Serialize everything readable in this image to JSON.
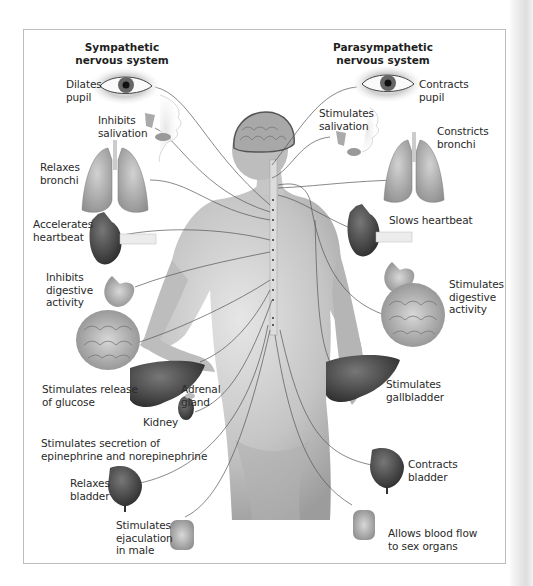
{
  "headers": {
    "sympathetic": [
      "Sympathetic",
      "nervous system"
    ],
    "parasympathetic": [
      "Parasympathetic",
      "nervous system"
    ]
  },
  "sympathetic_effects": [
    {
      "organ": "eye",
      "lines": [
        "Dilates",
        "pupil"
      ]
    },
    {
      "organ": "salivary-glands",
      "lines": [
        "Inhibits",
        "salivation"
      ]
    },
    {
      "organ": "lungs",
      "lines": [
        "Relaxes",
        "bronchi"
      ]
    },
    {
      "organ": "heart",
      "lines": [
        "Accelerates",
        "heartbeat"
      ]
    },
    {
      "organ": "stomach-intestines",
      "lines": [
        "Inhibits",
        "digestive",
        "activity"
      ]
    },
    {
      "organ": "liver",
      "lines": [
        "Stimulates release",
        "of glucose"
      ]
    },
    {
      "organ": "adrenal-gland",
      "lines": [
        "Adrenal",
        "gland"
      ]
    },
    {
      "organ": "kidney",
      "lines": [
        "Kidney"
      ]
    },
    {
      "organ": "adrenal-secretion",
      "lines": [
        "Stimulates secretion of",
        "epinephrine and norepinephrine"
      ]
    },
    {
      "organ": "bladder",
      "lines": [
        "Relaxes",
        "bladder"
      ]
    },
    {
      "organ": "genitals",
      "lines": [
        "Stimulates",
        "ejaculation",
        "in male"
      ]
    }
  ],
  "parasympathetic_effects": [
    {
      "organ": "eye",
      "lines": [
        "Contracts",
        "pupil"
      ]
    },
    {
      "organ": "salivary-glands",
      "lines": [
        "Stimulates",
        "salivation"
      ]
    },
    {
      "organ": "lungs",
      "lines": [
        "Constricts",
        "bronchi"
      ]
    },
    {
      "organ": "heart",
      "lines": [
        "Slows heartbeat"
      ]
    },
    {
      "organ": "stomach-intestines",
      "lines": [
        "Stimulates",
        "digestive",
        "activity"
      ]
    },
    {
      "organ": "liver",
      "lines": [
        "Stimulates",
        "gallbladder"
      ]
    },
    {
      "organ": "bladder",
      "lines": [
        "Contracts",
        "bladder"
      ]
    },
    {
      "organ": "genitals",
      "lines": [
        "Allows blood flow",
        "to sex organs"
      ]
    }
  ],
  "colors": {
    "frame_border": "#bdbdbd",
    "nerve_line": "#555555",
    "organ_dark": "#3a3a3a",
    "organ_mid": "#8a8a8a",
    "skin": "#c9c9c9"
  }
}
